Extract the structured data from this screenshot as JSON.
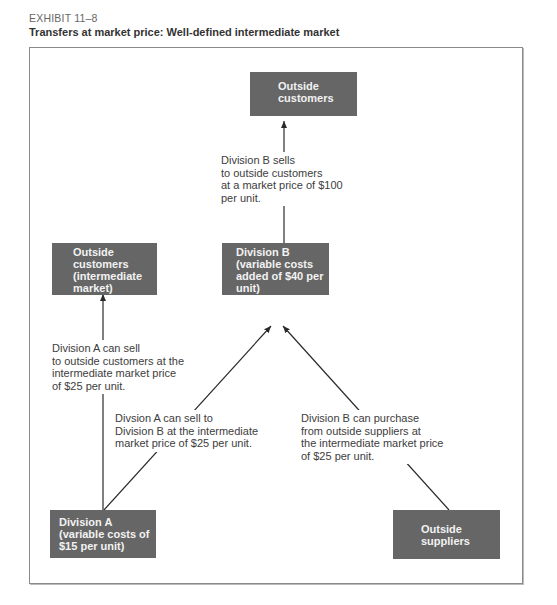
{
  "header": {
    "exhibit": "EXHIBIT 11–8",
    "title": "Transfers at market price: Well-defined intermediate market"
  },
  "colors": {
    "box_fill": "#666666",
    "box_text": "#f2f2f2",
    "line": "#2a2a2a",
    "frame": "#8a8a8a"
  },
  "boxes": {
    "outside_customers": {
      "lines": [
        "Outside",
        "customers"
      ]
    },
    "outside_customers_intermediate": {
      "lines": [
        "Outside",
        "customers",
        "(intermediate",
        "market)"
      ]
    },
    "division_b": {
      "lines": [
        "Division B",
        "(variable costs",
        "added of $40 per",
        "unit)"
      ]
    },
    "division_a": {
      "lines": [
        "Division A",
        "(variable costs of",
        "$15 per unit)"
      ]
    },
    "outside_suppliers": {
      "lines": [
        "Outside",
        "suppliers"
      ]
    }
  },
  "labels": {
    "b_sells": {
      "lines": [
        "Division B sells",
        "to outside customers",
        "at a market price of $100",
        "per unit."
      ]
    },
    "a_sells_outside": {
      "lines": [
        "Division A can sell",
        "to outside customers at the",
        "intermediate market price",
        "of $25 per unit."
      ]
    },
    "a_sells_to_b": {
      "lines": [
        "Divsion A can sell to",
        "Division B at the intermediate",
        "market price of $25 per unit."
      ]
    },
    "b_purchases": {
      "lines": [
        "Division B can purchase",
        "from outside suppliers at",
        "the intermediate market price",
        "of $25 per unit."
      ]
    }
  },
  "flows": [
    {
      "from": "Division B",
      "to": "Outside customers",
      "price": "$100"
    },
    {
      "from": "Division A",
      "to": "Outside customers (intermediate market)",
      "price": "$25"
    },
    {
      "from": "Division A",
      "to": "Division B",
      "price": "$25"
    },
    {
      "from": "Outside suppliers",
      "to": "Division B",
      "price": "$25"
    }
  ]
}
